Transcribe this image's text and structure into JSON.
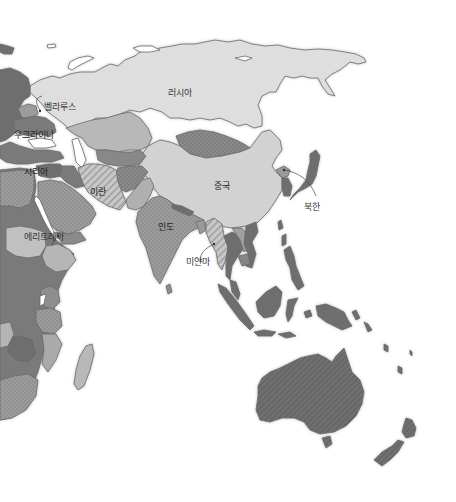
{
  "map": {
    "title": "",
    "colors": {
      "background": "#ffffff",
      "light": "#dedede",
      "medium_light": "#b8b8b8",
      "medium": "#a3a3a3",
      "dark": "#7a7a7a",
      "darker": "#6a6a6a",
      "outline": "#6a6a6a",
      "leader_line": "#444444"
    },
    "labels": [
      {
        "id": "russia",
        "text": "러시아"
      },
      {
        "id": "belarus",
        "text": "벨라루스"
      },
      {
        "id": "ukraine",
        "text": "우크라이나"
      },
      {
        "id": "syria",
        "text": "시리아"
      },
      {
        "id": "iran",
        "text": "이란"
      },
      {
        "id": "eritrea",
        "text": "에리트레아"
      },
      {
        "id": "india",
        "text": "인도"
      },
      {
        "id": "china",
        "text": "중국"
      },
      {
        "id": "myanmar",
        "text": "미얀마"
      },
      {
        "id": "north_korea",
        "text": "북한"
      }
    ],
    "legend_patterns": [
      "solid-dark",
      "dotted",
      "striped",
      "solid-light"
    ]
  }
}
